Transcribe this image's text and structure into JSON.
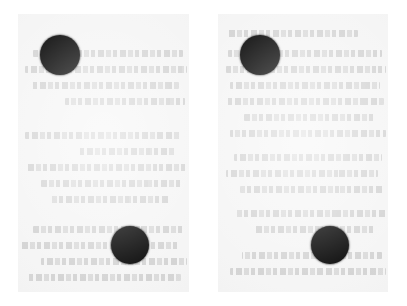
{
  "image": {
    "kind": "scanned-document-pair",
    "width": 407,
    "height": 306,
    "background_color": "#ffffff",
    "paper_color": "#f5f5f5",
    "dot_color": "#070707",
    "showthrough_color": "#969696",
    "showthrough_note": "faint mirrored text bleeding through from the reverse side of the sheet; illegible"
  },
  "panels": [
    {
      "name": "left-panel",
      "x": 18,
      "y": 14,
      "width": 171,
      "height": 278,
      "dots": [
        {
          "name": "dot-upper-left",
          "cx": 42,
          "cy": 41,
          "r": 20
        },
        {
          "name": "dot-lower-right",
          "cx": 112,
          "cy": 231,
          "r": 19
        }
      ],
      "showthrough_lines": [
        {
          "x": 6,
          "y": 36,
          "w": 150
        },
        {
          "x": 2,
          "y": 52,
          "w": 162
        },
        {
          "x": 10,
          "y": 68,
          "w": 148
        },
        {
          "x": 4,
          "y": 84,
          "w": 120
        },
        {
          "x": 8,
          "y": 118,
          "w": 156
        },
        {
          "x": 14,
          "y": 134,
          "w": 96
        },
        {
          "x": 2,
          "y": 150,
          "w": 160
        },
        {
          "x": 6,
          "y": 166,
          "w": 142
        },
        {
          "x": 20,
          "y": 182,
          "w": 118
        },
        {
          "x": 4,
          "y": 212,
          "w": 152
        },
        {
          "x": 10,
          "y": 228,
          "w": 158
        },
        {
          "x": 2,
          "y": 244,
          "w": 146
        },
        {
          "x": 8,
          "y": 260,
          "w": 154
        }
      ]
    },
    {
      "name": "right-panel",
      "x": 218,
      "y": 14,
      "width": 170,
      "height": 278,
      "dots": [
        {
          "name": "dot-upper-left",
          "cx": 42,
          "cy": 41,
          "r": 20
        },
        {
          "name": "dot-lower-right",
          "cx": 112,
          "cy": 231,
          "r": 19
        }
      ],
      "showthrough_lines": [
        {
          "x": 30,
          "y": 16,
          "w": 130
        },
        {
          "x": 6,
          "y": 36,
          "w": 154
        },
        {
          "x": 2,
          "y": 52,
          "w": 160
        },
        {
          "x": 8,
          "y": 68,
          "w": 150
        },
        {
          "x": 4,
          "y": 84,
          "w": 158
        },
        {
          "x": 12,
          "y": 100,
          "w": 132
        },
        {
          "x": 2,
          "y": 116,
          "w": 156
        },
        {
          "x": 6,
          "y": 140,
          "w": 148
        },
        {
          "x": 10,
          "y": 156,
          "w": 152
        },
        {
          "x": 4,
          "y": 172,
          "w": 144
        },
        {
          "x": 2,
          "y": 196,
          "w": 150
        },
        {
          "x": 14,
          "y": 212,
          "w": 120
        },
        {
          "x": 6,
          "y": 238,
          "w": 140
        },
        {
          "x": 2,
          "y": 254,
          "w": 156
        }
      ]
    }
  ]
}
